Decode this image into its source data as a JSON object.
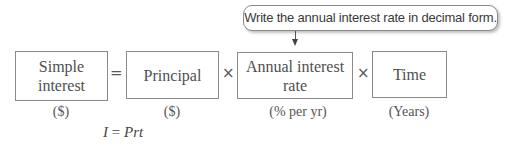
{
  "callout": {
    "text": "Write the annual interest rate in decimal form."
  },
  "equation": {
    "terms": [
      {
        "label": "Simple interest",
        "line1": "Simple",
        "line2": "interest",
        "unit": "($)"
      },
      {
        "label": "Principal",
        "unit": "($)"
      },
      {
        "label": "Annual interest rate",
        "line1": "Annual interest",
        "line2": "rate",
        "unit": "(% per yr)"
      },
      {
        "label": "Time",
        "unit": "(Years)"
      }
    ],
    "operators": [
      "=",
      "×",
      "×"
    ]
  },
  "formula": {
    "lhs": "I",
    "eq": "=",
    "rhs": "Prt"
  },
  "colors": {
    "border": "#8a8a8a",
    "text": "#4a4a4a"
  }
}
